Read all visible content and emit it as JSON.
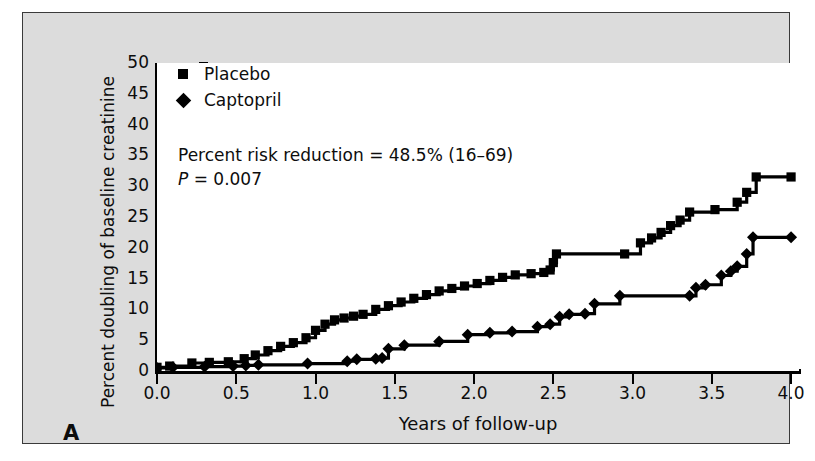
{
  "panel_letter": "A",
  "axes": {
    "x_title": "Years of follow-up",
    "y_title": "Percent doubling of baseline creatinine",
    "x_ticks": [
      "0.0",
      "0.5",
      "1.0",
      "1.5",
      "2.0",
      "2.5",
      "3.0",
      "3.5",
      "4.0"
    ],
    "y_ticks": [
      "50",
      "45",
      "40",
      "35",
      "30",
      "25",
      "20",
      "15",
      "10",
      "5",
      "0"
    ]
  },
  "legend": {
    "items": [
      {
        "label": "Placebo",
        "marker": "square-marker"
      },
      {
        "label": "Captopril",
        "marker": "diamond-marker"
      }
    ]
  },
  "annotation": {
    "risk_reduction": "Percent risk reduction = 48.5% (16–69)",
    "p_label": "P",
    "p_value": " = 0.007"
  },
  "colors": {
    "ink": "#000000",
    "panel_background": "#dcdcdc",
    "plot_background": "#ffffff",
    "frame": "#3a3a3a"
  },
  "chart_data": {
    "type": "line",
    "title": "",
    "subtitle": "",
    "xlabel": "Years of follow-up",
    "ylabel": "Percent doubling of baseline creatinine",
    "xlim": [
      0.0,
      4.05
    ],
    "ylim": [
      0,
      50
    ],
    "xticks": [
      0.0,
      0.5,
      1.0,
      1.5,
      2.0,
      2.5,
      3.0,
      3.5,
      4.0
    ],
    "yticks": [
      0,
      5,
      10,
      15,
      20,
      25,
      30,
      35,
      40,
      45,
      50
    ],
    "grid": false,
    "legend_position": "top-left",
    "annotations": [
      "Percent risk reduction = 48.5% (16–69)",
      "P = 0.007"
    ],
    "step_style": "step-post",
    "series": [
      {
        "name": "Placebo",
        "marker": "square",
        "x": [
          0.0,
          0.08,
          0.22,
          0.33,
          0.45,
          0.55,
          0.62,
          0.7,
          0.78,
          0.86,
          0.94,
          1.0,
          1.06,
          1.12,
          1.18,
          1.24,
          1.3,
          1.38,
          1.46,
          1.54,
          1.62,
          1.7,
          1.78,
          1.86,
          1.94,
          2.02,
          2.1,
          2.18,
          2.26,
          2.36,
          2.44,
          2.48,
          2.5,
          2.52,
          2.95,
          3.05,
          3.12,
          3.18,
          3.24,
          3.3,
          3.36,
          3.52,
          3.66,
          3.72,
          3.78,
          4.0
        ],
        "y": [
          0.6,
          0.8,
          1.3,
          1.4,
          1.5,
          2.0,
          2.6,
          3.3,
          4.0,
          4.6,
          5.4,
          6.6,
          7.6,
          8.3,
          8.6,
          8.9,
          9.2,
          10.0,
          10.6,
          11.2,
          11.8,
          12.4,
          13.0,
          13.4,
          13.8,
          14.2,
          14.7,
          15.2,
          15.6,
          15.8,
          16.0,
          16.4,
          17.6,
          19.0,
          19.0,
          20.8,
          21.6,
          22.5,
          23.6,
          24.5,
          25.8,
          26.2,
          27.4,
          29.0,
          31.5,
          31.5
        ]
      },
      {
        "name": "Captopril",
        "marker": "diamond",
        "x": [
          0.0,
          0.1,
          0.3,
          0.48,
          0.56,
          0.64,
          0.95,
          1.2,
          1.26,
          1.38,
          1.42,
          1.46,
          1.56,
          1.78,
          1.96,
          2.1,
          2.24,
          2.4,
          2.48,
          2.54,
          2.6,
          2.7,
          2.76,
          2.92,
          3.36,
          3.4,
          3.46,
          3.56,
          3.62,
          3.66,
          3.72,
          3.76,
          4.0
        ],
        "y": [
          0.5,
          0.6,
          0.7,
          0.8,
          0.9,
          1.0,
          1.2,
          1.6,
          1.9,
          2.0,
          2.1,
          3.6,
          4.2,
          4.8,
          5.9,
          6.2,
          6.4,
          7.2,
          7.6,
          8.8,
          9.2,
          9.3,
          10.9,
          12.2,
          12.2,
          13.5,
          14.0,
          15.5,
          16.2,
          17.0,
          19.0,
          21.7,
          21.7
        ]
      }
    ]
  }
}
